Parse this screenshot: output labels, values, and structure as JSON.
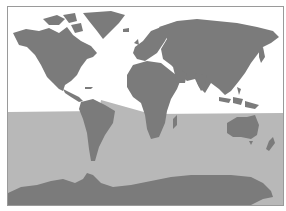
{
  "map": {
    "type": "world-map",
    "projection": "equirectangular-like",
    "colors": {
      "background": "#ffffff",
      "land": "#7b7b7b",
      "shaded_region": "#b8b8b8",
      "border": "#9a9a9a"
    },
    "shaded_region": "southern hemisphere / below terminator line",
    "labels": []
  }
}
